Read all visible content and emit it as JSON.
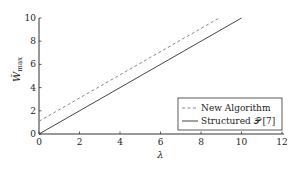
{
  "chart_data": {
    "type": "line",
    "title": "",
    "xlabel": "λ",
    "ylabel": "W̄max",
    "xlim": [
      0,
      12
    ],
    "ylim": [
      0,
      10
    ],
    "xticks": [
      "0",
      "2",
      "4",
      "6",
      "8",
      "10",
      "12"
    ],
    "yticks": [
      "0",
      "2",
      "4",
      "6",
      "8",
      "10"
    ],
    "grid": false,
    "legend_position": "lower right",
    "series": [
      {
        "name": "New Algorithm",
        "style": "dashed",
        "color": "#888888",
        "x": [
          0,
          8.9
        ],
        "y": [
          1.1,
          10
        ]
      },
      {
        "name": "Structured 𝒫 [7]",
        "style": "solid",
        "color": "#444444",
        "x": [
          0,
          10
        ],
        "y": [
          0,
          10
        ]
      }
    ]
  },
  "legend": {
    "items": [
      "New Algorithm",
      "Structured 𝒫 [7]"
    ]
  },
  "axes": {
    "xlabel": "λ",
    "ylabel_main": "W̃",
    "ylabel_sub": "max"
  }
}
